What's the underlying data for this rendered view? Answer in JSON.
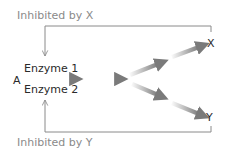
{
  "diagram": {
    "type": "metabolic-pathway-feedback-inhibition",
    "labels": {
      "inhibited_by_x": "Inhibited by X",
      "inhibited_by_y": "Inhibited by Y",
      "substrate": "A",
      "enzyme_1": "Enzyme 1",
      "enzyme_2": "Enzyme 2",
      "product_x": "X",
      "product_y": "Y"
    },
    "nodes": [
      "A",
      "X",
      "Y"
    ],
    "edges": [
      {
        "from": "A",
        "to": "intermediate",
        "label": "Enzyme 1 / Enzyme 2"
      },
      {
        "from": "intermediate",
        "to": "branch"
      },
      {
        "from": "branch",
        "to": "X"
      },
      {
        "from": "branch",
        "to": "Y"
      },
      {
        "from": "X",
        "to": "Enzyme 1",
        "type": "inhibition",
        "label": "Inhibited by X"
      },
      {
        "from": "Y",
        "to": "Enzyme 2",
        "type": "inhibition",
        "label": "Inhibited by Y"
      }
    ],
    "colors": {
      "feedback_line": "#8a8a8a",
      "arrow": "#7a7a7a",
      "text_dark": "#2a2a2a",
      "text_gray": "#8a8a8a"
    }
  }
}
